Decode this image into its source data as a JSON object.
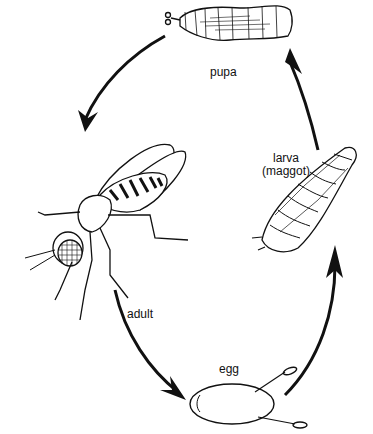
{
  "diagram": {
    "stages": [
      {
        "id": "pupa",
        "label": "pupa"
      },
      {
        "id": "adult",
        "label": "adult"
      },
      {
        "id": "egg",
        "label": "egg"
      },
      {
        "id": "larva",
        "label_line1": "larva",
        "label_line2": "(maggot)"
      }
    ],
    "cycle_order": [
      "pupa",
      "adult",
      "egg",
      "larva",
      "pupa"
    ],
    "direction": "counter-clockwise arrows: pupa -> adult -> egg -> larva -> pupa",
    "colors": {
      "ink": "#111111",
      "background": "#ffffff"
    }
  }
}
